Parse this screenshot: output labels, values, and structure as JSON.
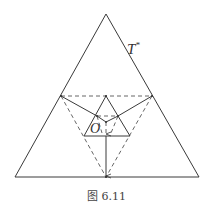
{
  "figure": {
    "caption": "图 6.11",
    "labels": {
      "outer_triangle": "T*",
      "outer_triangle_main": "T",
      "outer_triangle_sup": "*",
      "center_point": "O"
    },
    "colors": {
      "line": "#3a3a3a",
      "dashed": "#555555",
      "background": "#ffffff"
    }
  }
}
